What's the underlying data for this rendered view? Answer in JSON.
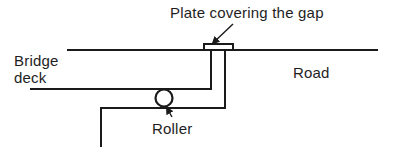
{
  "diagram": {
    "labels": {
      "plate": "Plate covering the gap",
      "bridge": "Bridge",
      "deck": "deck",
      "road": "Road",
      "roller": "Roller"
    },
    "colors": {
      "stroke": "#1a1a1a",
      "background": "#ffffff",
      "plate_fill": "#ffffff"
    },
    "elements": {
      "road_surface_line": {
        "x1": 67,
        "y1": 50,
        "x2": 378,
        "y2": 50
      },
      "plate": {
        "x": 204,
        "y": 44,
        "width": 29,
        "height": 6
      },
      "bridge_deck_underside": {
        "x1": 30,
        "y1": 89,
        "x2": 211,
        "y2": 89
      },
      "bridge_deck_end": {
        "x1": 211,
        "y1": 50,
        "x2": 211,
        "y2": 89
      },
      "abutment_top": {
        "x1": 101,
        "y1": 108,
        "x2": 225,
        "y2": 108
      },
      "abutment_face": {
        "x1": 225,
        "y1": 50,
        "x2": 225,
        "y2": 108
      },
      "abutment_back": {
        "x1": 101,
        "y1": 108,
        "x2": 101,
        "y2": 147
      },
      "roller": {
        "cx": 164,
        "cy": 98,
        "r": 8
      },
      "plate_arrow": {
        "x1": 233,
        "y1": 24,
        "x2": 212,
        "y2": 44
      },
      "roller_arrow": {
        "x1": 172,
        "y1": 117,
        "x2": 166,
        "y2": 107
      }
    }
  }
}
